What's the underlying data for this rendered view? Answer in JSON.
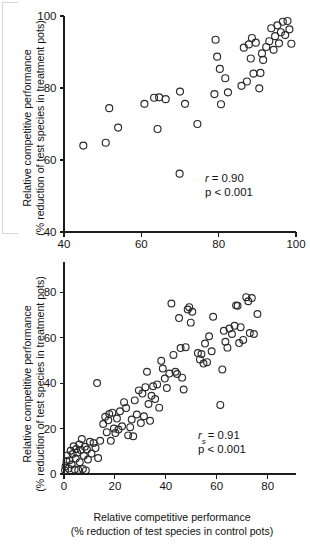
{
  "figure": {
    "background_color": "#ffffff",
    "marker_color": "#2a2a2a",
    "axis_color": "#1c1c1c"
  },
  "panels": [
    {
      "id": "top",
      "stats": {
        "coefficient_label": "r",
        "coefficient_subscript": "",
        "coefficient_value": "= 0.90",
        "pvalue": "p < 0.001"
      }
    },
    {
      "id": "bottom",
      "stats": {
        "coefficient_label": "r",
        "coefficient_subscript": "s",
        "coefficient_value": "= 0.91",
        "pvalue": "p < 0.001"
      }
    }
  ],
  "chart_data": [
    {
      "type": "scatter",
      "title": "",
      "panel": "top",
      "xlabel": "",
      "ylabel": "Relative competitive performance (% reduction of test species in treatment pots)",
      "ylabel_line1": "Relative competitive performance",
      "ylabel_line2": "(% reduction of test species in treatment pots)",
      "xlim": [
        40,
        100
      ],
      "ylim": [
        40,
        100
      ],
      "xticks": [
        40,
        60,
        80,
        100
      ],
      "yticks": [
        40,
        60,
        80,
        100
      ],
      "xticklabels": [
        "40",
        "60",
        "80",
        "100"
      ],
      "yticklabels": [
        "40",
        "60",
        "80",
        "100"
      ],
      "grid": false,
      "legend": "none",
      "annotations": [
        "r = 0.90",
        "p < 0.001"
      ],
      "correlation_r": 0.9,
      "p_value": "<0.001",
      "n_points": 45,
      "points": [
        [
          45.0,
          64.0
        ],
        [
          50.8,
          64.8
        ],
        [
          51.7,
          74.4
        ],
        [
          54.0,
          69.0
        ],
        [
          60.8,
          75.6
        ],
        [
          63.3,
          77.3
        ],
        [
          64.2,
          68.6
        ],
        [
          64.6,
          77.4
        ],
        [
          66.3,
          76.9
        ],
        [
          69.9,
          56.2
        ],
        [
          70.0,
          79.0
        ],
        [
          71.3,
          75.6
        ],
        [
          74.5,
          70.0
        ],
        [
          78.9,
          78.3
        ],
        [
          79.2,
          93.4
        ],
        [
          79.6,
          88.7
        ],
        [
          80.3,
          85.3
        ],
        [
          80.6,
          75.5
        ],
        [
          81.7,
          82.7
        ],
        [
          82.4,
          78.8
        ],
        [
          85.9,
          80.6
        ],
        [
          86.5,
          91.2
        ],
        [
          87.3,
          81.8
        ],
        [
          87.8,
          92.1
        ],
        [
          88.3,
          88.2
        ],
        [
          88.6,
          93.9
        ],
        [
          89.0,
          84.0
        ],
        [
          89.6,
          92.6
        ],
        [
          90.5,
          79.9
        ],
        [
          90.8,
          84.2
        ],
        [
          91.2,
          89.6
        ],
        [
          91.5,
          87.8
        ],
        [
          92.3,
          91.4
        ],
        [
          93.1,
          93.0
        ],
        [
          93.6,
          96.6
        ],
        [
          94.2,
          90.6
        ],
        [
          94.6,
          94.4
        ],
        [
          95.2,
          97.4
        ],
        [
          95.6,
          92.4
        ],
        [
          96.1,
          95.5
        ],
        [
          96.6,
          98.4
        ],
        [
          97.2,
          94.7
        ],
        [
          97.8,
          98.6
        ],
        [
          98.3,
          96.3
        ],
        [
          98.8,
          92.3
        ]
      ]
    },
    {
      "type": "scatter",
      "title": "",
      "panel": "bottom",
      "xlabel": "Relative competitive performance (% reduction of test species in control pots)",
      "xlabel_line1": "Relative competitive performance",
      "xlabel_line2": "(% reduction of test species in control pots)",
      "ylabel": "Relative competitive performance (% reduction of test species in treatment pots)",
      "ylabel_line1": "Relative competitive performance",
      "ylabel_line2": "(% reduction of test species in treatment pots)",
      "xlim": [
        0,
        88
      ],
      "ylim": [
        0,
        88
      ],
      "xticks": [
        0,
        20,
        40,
        60,
        80
      ],
      "yticks": [
        0,
        20,
        40,
        60,
        80
      ],
      "xticklabels": [
        "0",
        "20",
        "40",
        "60",
        "80"
      ],
      "yticklabels": [
        "0",
        "20",
        "40",
        "60",
        "80"
      ],
      "grid": false,
      "legend": "none",
      "annotations": [
        "rs = 0.91",
        "p < 0.001"
      ],
      "correlation_rs": 0.91,
      "p_value": "<0.001",
      "n_points": 96,
      "points": [
        [
          0.4,
          1.6
        ],
        [
          0.6,
          3.4
        ],
        [
          1.0,
          5.6
        ],
        [
          1.4,
          8.2
        ],
        [
          1.8,
          2.4
        ],
        [
          2.2,
          6.0
        ],
        [
          2.6,
          10.2
        ],
        [
          3.0,
          4.2
        ],
        [
          3.4,
          8.8
        ],
        [
          3.8,
          12.2
        ],
        [
          4.2,
          2.0
        ],
        [
          4.6,
          6.8
        ],
        [
          4.8,
          11.0
        ],
        [
          5.2,
          9.4
        ],
        [
          5.6,
          1.8
        ],
        [
          6.0,
          13.0
        ],
        [
          6.2,
          5.2
        ],
        [
          6.6,
          10.6
        ],
        [
          7.0,
          15.4
        ],
        [
          7.4,
          2.2
        ],
        [
          7.8,
          8.0
        ],
        [
          8.2,
          12.0
        ],
        [
          8.6,
          1.6
        ],
        [
          9.0,
          10.8
        ],
        [
          9.4,
          6.4
        ],
        [
          10.2,
          14.2
        ],
        [
          10.8,
          9.0
        ],
        [
          11.6,
          13.6
        ],
        [
          12.4,
          11.4
        ],
        [
          13.0,
          40.0
        ],
        [
          13.4,
          7.0
        ],
        [
          14.2,
          14.6
        ],
        [
          15.4,
          22.0
        ],
        [
          16.2,
          25.2
        ],
        [
          16.8,
          18.4
        ],
        [
          17.4,
          23.6
        ],
        [
          17.8,
          26.4
        ],
        [
          18.4,
          14.6
        ],
        [
          19.0,
          27.0
        ],
        [
          19.6,
          20.0
        ],
        [
          20.2,
          18.0
        ],
        [
          20.8,
          24.4
        ],
        [
          21.4,
          19.6
        ],
        [
          22.0,
          27.6
        ],
        [
          22.8,
          21.0
        ],
        [
          23.6,
          31.6
        ],
        [
          24.4,
          29.0
        ],
        [
          25.2,
          17.0
        ],
        [
          26.0,
          20.6
        ],
        [
          26.6,
          24.0
        ],
        [
          27.2,
          16.6
        ],
        [
          27.8,
          32.4
        ],
        [
          28.6,
          26.2
        ],
        [
          29.4,
          36.8
        ],
        [
          30.2,
          22.4
        ],
        [
          30.8,
          35.4
        ],
        [
          31.4,
          25.4
        ],
        [
          32.0,
          38.2
        ],
        [
          32.6,
          45.0
        ],
        [
          33.2,
          30.8
        ],
        [
          33.8,
          23.4
        ],
        [
          34.4,
          34.4
        ],
        [
          35.0,
          38.6
        ],
        [
          35.8,
          33.0
        ],
        [
          36.6,
          39.4
        ],
        [
          37.4,
          29.2
        ],
        [
          38.2,
          49.8
        ],
        [
          38.8,
          46.4
        ],
        [
          39.6,
          42.0
        ],
        [
          40.4,
          37.8
        ],
        [
          41.4,
          44.2
        ],
        [
          42.2,
          75.0
        ],
        [
          43.0,
          52.4
        ],
        [
          43.8,
          45.0
        ],
        [
          44.4,
          44.0
        ],
        [
          45.2,
          68.6
        ],
        [
          45.8,
          55.4
        ],
        [
          46.4,
          42.4
        ],
        [
          47.0,
          37.2
        ],
        [
          47.8,
          55.8
        ],
        [
          48.6,
          72.4
        ],
        [
          49.2,
          73.4
        ],
        [
          49.8,
          66.6
        ],
        [
          50.4,
          71.4
        ],
        [
          52.6,
          53.2
        ],
        [
          53.4,
          50.4
        ],
        [
          54.0,
          52.8
        ],
        [
          54.8,
          48.6
        ],
        [
          55.4,
          57.4
        ],
        [
          56.2,
          49.2
        ],
        [
          57.0,
          60.6
        ],
        [
          58.0,
          54.0
        ],
        [
          58.6,
          69.2
        ],
        [
          61.4,
          30.4
        ],
        [
          62.2,
          46.0
        ],
        [
          62.8,
          63.0
        ],
        [
          63.4,
          58.2
        ],
        [
          64.2,
          55.6
        ],
        [
          65.0,
          64.0
        ],
        [
          66.0,
          61.6
        ],
        [
          67.0,
          65.2
        ],
        [
          67.6,
          74.2
        ],
        [
          68.2,
          74.0
        ],
        [
          68.8,
          57.6
        ],
        [
          69.4,
          64.6
        ],
        [
          70.4,
          59.0
        ],
        [
          71.6,
          77.8
        ],
        [
          72.4,
          76.0
        ],
        [
          73.0,
          62.0
        ],
        [
          73.8,
          77.4
        ],
        [
          74.6,
          61.6
        ],
        [
          76.0,
          70.4
        ]
      ]
    }
  ]
}
